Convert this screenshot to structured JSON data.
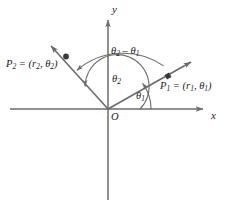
{
  "figure": {
    "background_color": "#ffffff",
    "line_color": "#6b6b6b",
    "text_color": "#1b1b1b",
    "width": 232,
    "height": 218
  },
  "axes": {
    "x_label": "x",
    "y_label": "y",
    "origin_label": "O",
    "origin": {
      "x": 108,
      "y": 109
    },
    "x_axis": {
      "start_x": 10,
      "end_x": 205,
      "y": 109
    },
    "y_axis": {
      "x": 108,
      "start_y": 18,
      "end_y": 200
    }
  },
  "points": [
    {
      "name": "P1",
      "label_text": "P",
      "label_sub": "1",
      "label_rest": " = (r",
      "label_sub2": "1",
      "label_mid": ", θ",
      "label_sub3": "1",
      "label_end": ")",
      "full_label": "P₁ = (r₁, θ₁)",
      "marker_shape": "square",
      "marker": {
        "x": 168,
        "y": 76
      },
      "ray_tip": {
        "x": 193,
        "y": 61
      },
      "angle_label": "θ₁"
    },
    {
      "name": "P2",
      "label_text": "P",
      "label_sub": "2",
      "label_rest": " = (r",
      "label_sub2": "2",
      "label_mid": ", θ",
      "label_sub3": "2",
      "label_end": ")",
      "full_label": "P₂ = (r₂, θ₂)",
      "marker_shape": "circle",
      "marker": {
        "x": 66,
        "y": 56
      },
      "ray_tip": {
        "x": 49,
        "y": 44
      },
      "angle_label": "θ₂"
    }
  ],
  "angles": {
    "theta1": "θ₁",
    "theta2": "θ₂",
    "difference": "θ₂ – θ₁",
    "difference_parts": {
      "theta": "θ",
      "sub_a": "2",
      "minus": " – ",
      "sub_b": "1"
    }
  }
}
